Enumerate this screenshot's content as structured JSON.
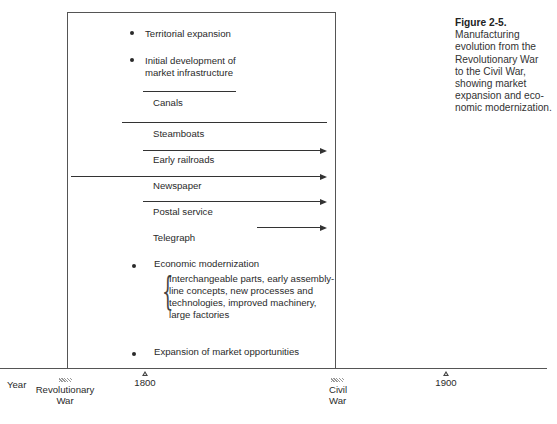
{
  "caption": {
    "figure_label": "Figure 2-5.",
    "lines": [
      "Manufacturing",
      "evolution from the",
      "Revolutionary War",
      "to the Civil War,",
      "showing market",
      "expansion and eco-",
      "nomic modernization."
    ]
  },
  "diagram": {
    "bullets": {
      "territorial": "Territorial expansion",
      "infrastructure_1": "Initial development of",
      "infrastructure_2": "market infrastructure",
      "economic": "Economic modernization",
      "expansion": "Expansion of market  opportunities"
    },
    "infrastructure_items": [
      {
        "label": "Canals",
        "line_type": "segment"
      },
      {
        "label": "Steamboats",
        "line_type": "arrow"
      },
      {
        "label": "Early railroads",
        "line_type": "arrow"
      },
      {
        "label": "Newspaper",
        "line_type": "arrow"
      },
      {
        "label": "Postal service",
        "line_type": "arrow"
      },
      {
        "label": "Telegraph",
        "line_type": "arrow"
      }
    ],
    "modernization_details": [
      "Interchangeable parts, early assembly-",
      "line concepts, new processes and",
      "technologies, improved machinery,",
      "large factories"
    ]
  },
  "timeline": {
    "axis_label": "Year",
    "ticks": [
      {
        "label": "1800"
      },
      {
        "label": "1900"
      }
    ],
    "events": [
      {
        "line1": "Revolutionary",
        "line2": "War"
      },
      {
        "line1": "Civil",
        "line2": "War"
      }
    ]
  }
}
